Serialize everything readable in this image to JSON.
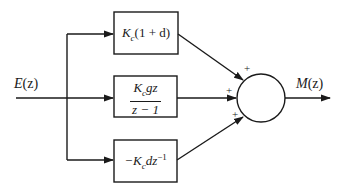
{
  "diagram": {
    "type": "block-diagram",
    "title": "",
    "input": {
      "label_main": "E",
      "label_arg": "(z)"
    },
    "output": {
      "label_main": "M",
      "label_arg": "(z)"
    },
    "blocks": [
      {
        "id": "proportional",
        "gain": "K",
        "gain_sub": "c",
        "rest": "(1 + d)"
      },
      {
        "id": "integral",
        "numerator_gain": "K",
        "numerator_sub": "c",
        "numerator_rest": "gz",
        "denominator": "z − 1"
      },
      {
        "id": "derivative",
        "prefix": "−K",
        "prefix_sub": "c",
        "rest": "dz",
        "rest_sup": "−1"
      }
    ],
    "summing_junction": {
      "signs": [
        "+",
        "+",
        "+"
      ]
    },
    "colors": {
      "stroke": "#1a1a1a",
      "background": "#ffffff"
    }
  }
}
